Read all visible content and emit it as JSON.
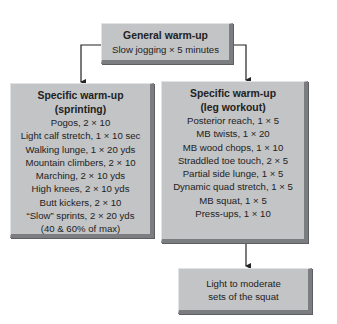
{
  "general": {
    "title": "General warm-up",
    "subtitle": "Slow jogging × 5 minutes"
  },
  "sprinting": {
    "title1": "Specific warm-up",
    "title2": "(sprinting)",
    "items": [
      "Pogos, 2 × 10",
      "Light calf stretch, 1 × 10 sec",
      "Walking lunge, 1 × 20 yds",
      "Mountain climbers, 2 × 10",
      "Marching, 2 × 10 yds",
      "High knees, 2 × 10 yds",
      "Butt kickers, 2 × 10",
      "“Slow” sprints, 2 × 20 yds",
      "(40 & 60% of max)"
    ]
  },
  "leg_workout": {
    "title1": "Specific warm-up",
    "title2": "(leg workout)",
    "items": [
      "Posterior reach, 1 × 5",
      "MB twists, 1 × 20",
      "MB wood chops, 1 × 10",
      "Straddled toe touch, 2 × 5",
      "Partial side lunge, 1 × 5",
      "Dynamic quad stretch, 1 × 5",
      "MB squat, 1 × 5",
      "Press-ups, 1 × 10"
    ]
  },
  "squat": {
    "line1": "Light to moderate",
    "line2": "sets of the squat"
  },
  "colors": {
    "box_fill": "#c3c4c6",
    "box_shadow": "#7c7d80",
    "connector": "#222222"
  }
}
